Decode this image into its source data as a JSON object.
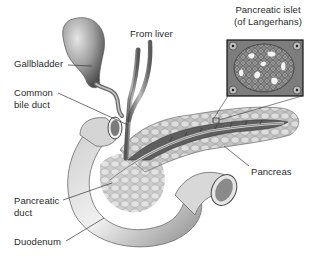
{
  "diagram": {
    "style": "grayscale anatomical illustration",
    "labels": {
      "gallbladder": "Gallbladder",
      "from_liver": "From liver",
      "common_bile_duct_line1": "Common",
      "common_bile_duct_line2": "bile duct",
      "islet_line1": "Pancreatic islet",
      "islet_line2": "(of Langerhans)",
      "pancreas": "Pancreas",
      "pancreatic_duct_line1": "Pancreatic",
      "pancreatic_duct_line2": "duct",
      "duodenum": "Duodenum"
    },
    "colors": {
      "background": "#ffffff",
      "text": "#2a2a2a",
      "leader_line": "#333333",
      "organ_light": "#d9d9d9",
      "organ_mid": "#9a9a9a",
      "organ_dark": "#4a4a4a",
      "inset_border": "#111111"
    }
  }
}
